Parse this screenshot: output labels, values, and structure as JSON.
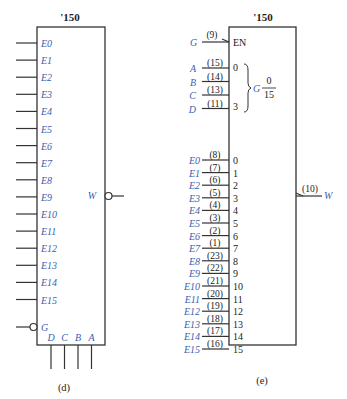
{
  "diagram_d": {
    "title": "'150",
    "caption": "(d)",
    "inputs": [
      "E0",
      "E1",
      "E2",
      "E3",
      "E4",
      "E5",
      "E6",
      "E7",
      "E8",
      "E9",
      "E10",
      "E11",
      "E12",
      "E13",
      "E14",
      "E15"
    ],
    "enable": "G",
    "selects": [
      "D",
      "C",
      "B",
      "A"
    ],
    "output": "W"
  },
  "diagram_e": {
    "title": "'150",
    "caption": "(e)",
    "enable": {
      "signal": "G",
      "pin": "(9)",
      "label": "EN"
    },
    "selects": [
      {
        "signal": "A",
        "pin": "(15)"
      },
      {
        "signal": "B",
        "pin": "(14)"
      },
      {
        "signal": "C",
        "pin": "(13)"
      },
      {
        "signal": "D",
        "pin": "(11)"
      }
    ],
    "select_range_low": "0",
    "select_range_high": "3",
    "group_label": "G",
    "group_frac_top": "0",
    "group_frac_bottom": "15",
    "data_inputs": [
      {
        "signal": "E0",
        "pin": "(8)",
        "index": "0"
      },
      {
        "signal": "E1",
        "pin": "(7)",
        "index": "1"
      },
      {
        "signal": "E2",
        "pin": "(6)",
        "index": "2"
      },
      {
        "signal": "E3",
        "pin": "(5)",
        "index": "3"
      },
      {
        "signal": "E4",
        "pin": "(4)",
        "index": "4"
      },
      {
        "signal": "E5",
        "pin": "(3)",
        "index": "5"
      },
      {
        "signal": "E6",
        "pin": "(2)",
        "index": "6"
      },
      {
        "signal": "E7",
        "pin": "(1)",
        "index": "7"
      },
      {
        "signal": "E8",
        "pin": "(23)",
        "index": "8"
      },
      {
        "signal": "E9",
        "pin": "(22)",
        "index": "9"
      },
      {
        "signal": "E10",
        "pin": "(21)",
        "index": "10"
      },
      {
        "signal": "E11",
        "pin": "(20)",
        "index": "11"
      },
      {
        "signal": "E12",
        "pin": "(19)",
        "index": "12"
      },
      {
        "signal": "E13",
        "pin": "(18)",
        "index": "13"
      },
      {
        "signal": "E14",
        "pin": "(17)",
        "index": "14"
      },
      {
        "signal": "E15",
        "pin": "(16)",
        "index": "15"
      }
    ],
    "output": {
      "signal": "W",
      "pin": "(10)"
    }
  }
}
